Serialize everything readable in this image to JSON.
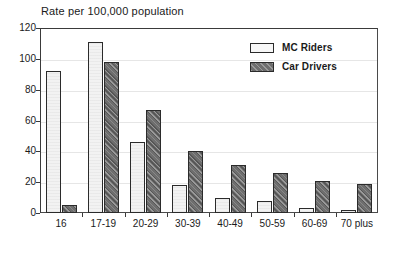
{
  "chart_data": {
    "type": "bar",
    "title": "Rate per 100,000 population",
    "xlabel": "",
    "ylabel": "",
    "ylim": [
      0,
      120
    ],
    "yticks": [
      0,
      20,
      40,
      60,
      80,
      100,
      120
    ],
    "grid": true,
    "legend_position": "top-right",
    "categories": [
      "16",
      "17-19",
      "20-29",
      "30-39",
      "40-49",
      "50-59",
      "60-69",
      "70 plus"
    ],
    "series": [
      {
        "name": "MC Riders",
        "color": "#f2f2f2",
        "values": [
          92,
          111,
          46,
          18,
          10,
          8,
          3,
          2
        ]
      },
      {
        "name": "Car Drivers",
        "color": "#6e6e6e",
        "values": [
          5,
          98,
          67,
          40,
          31,
          26,
          21,
          19
        ]
      }
    ]
  },
  "y_tick_labels": [
    "120",
    "100",
    "80",
    "60",
    "40",
    "20",
    "0"
  ],
  "legend": {
    "items": [
      {
        "label": "MC Riders",
        "swatch": "light"
      },
      {
        "label": "Car Drivers",
        "swatch": "dark"
      }
    ]
  }
}
